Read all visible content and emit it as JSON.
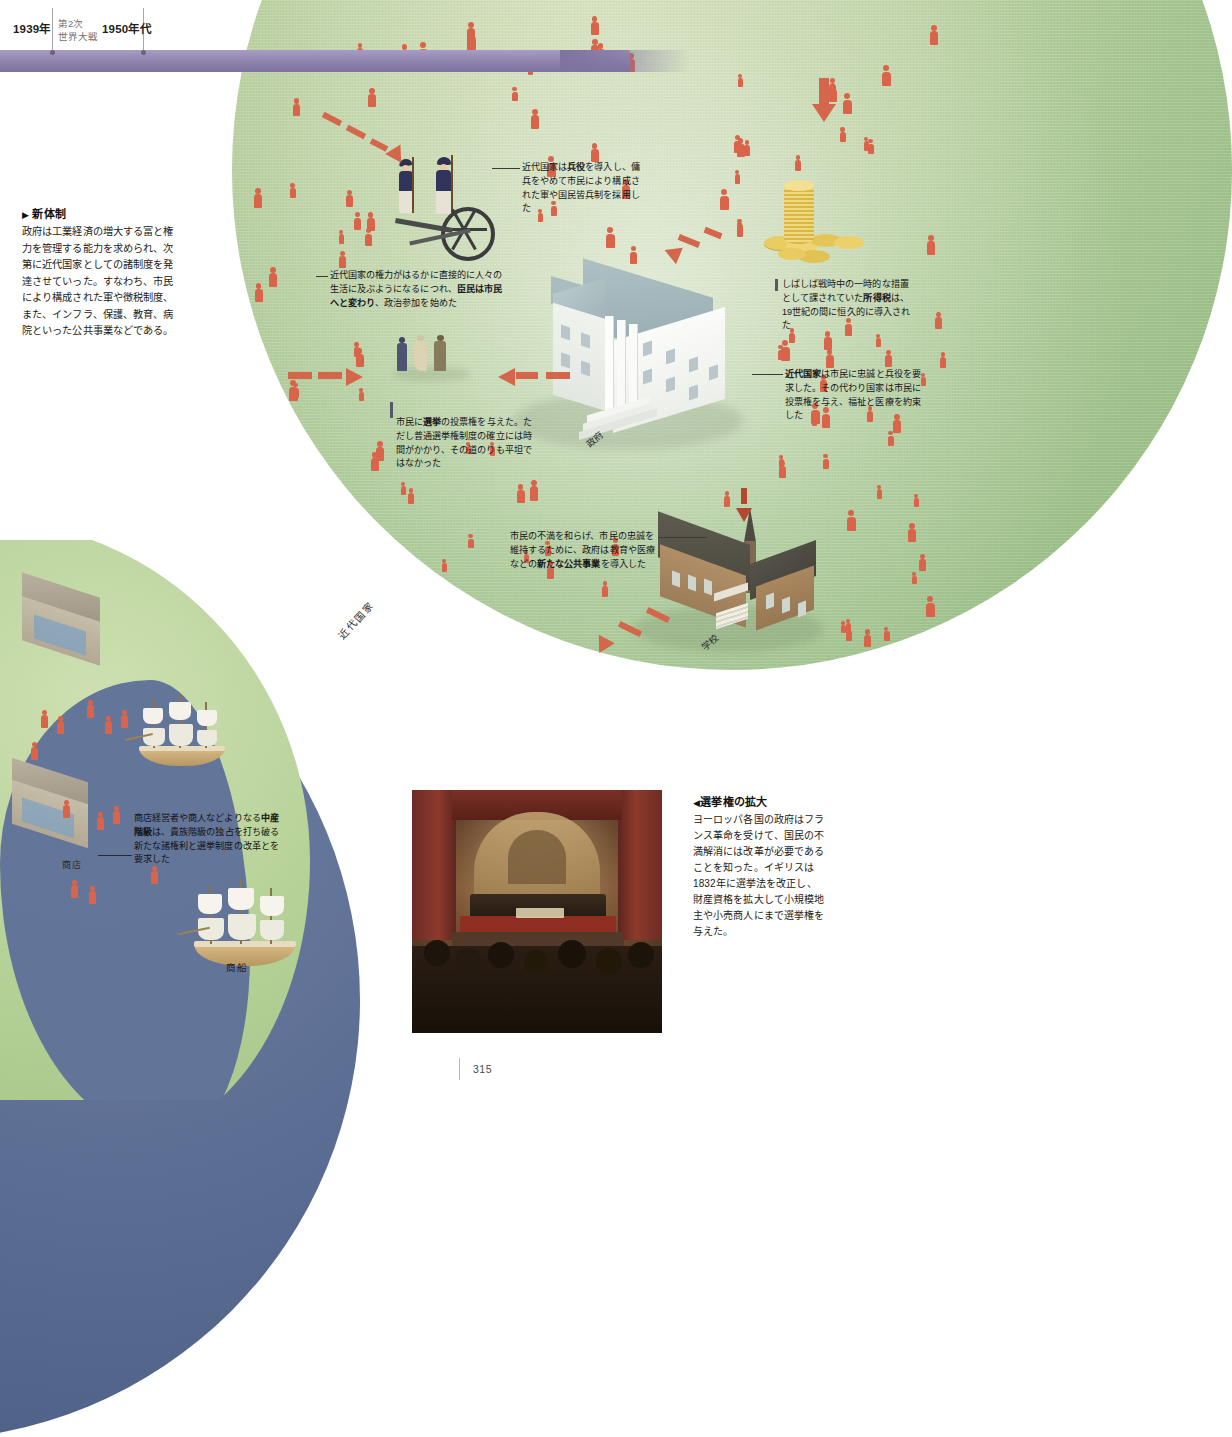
{
  "timeline": {
    "entries": [
      {
        "year": "1939年",
        "sub": "第2次\n世界大戦"
      },
      {
        "year": "1950年代",
        "sub": ""
      }
    ]
  },
  "intro": {
    "marker": "▶",
    "heading": "新体制",
    "body": "政府は工業経済の増大する富と権力を管理する能力を求められ、次第に近代国家としての諸制度を発達させていった。すなわち、市民により構成された軍や徴税制度、また、インフラ、保護、教育、病院といった公共事業などである。"
  },
  "callouts": {
    "conscription": "近代国家は兵役を導入し、傭兵をやめて市民により構成された軍や国民皆兵制を採用した",
    "conscription_bold": "兵役",
    "citizens": "近代国家の権力がはるかに直接的に人々の生活に及ぶようになるにつれ、臣民は市民へと変わり、政治参加を始めた",
    "citizens_bold": "臣民は市民へと変わり",
    "income_tax": "しばしば戦時中の一時的な措置として課されていた所得税は、19世紀の間に恒久的に導入された",
    "income_tax_bold": "所得税",
    "modern_state": "近代国家は市民に忠誠と兵役を要求した。その代わり国家は市民に投票権を与え、福祉と医療を約束した",
    "modern_state_bold": "近代国家",
    "suffrage": "市民に選挙の投票権を与えた。ただし普通選挙権制度の確立には時間がかかり、その道のりも平坦ではなかった",
    "suffrage_bold": "選挙",
    "public_works": "市民の不満を和らげ、市民の忠誠を維持するために、政府は教育や医療などの新たな公共事業を導入した",
    "public_works_bold": "新たな公共事業",
    "middle_class": "商店経営者や商人などよりなる中産階級は、貴族階級の独占を打ち破る新たな諸権利と選挙制度の改革とを要求した",
    "middle_class_bold": "中産階級"
  },
  "labels": {
    "government": "政府",
    "school": "学校",
    "modern_state_arc": "近代国家",
    "shop": "商店",
    "merchant_ship": "商船"
  },
  "figure_caption": {
    "marker": "◀",
    "heading": "選挙権の拡大",
    "body": "ヨーロッパ各国の政府はフランス革命を受けて、国民の不満解消には改革が必要であることを知った。イギリスは1832年に選挙法を改正し、財産資格を拡大して小規模地主や小売商人にまで選挙権を与えた。"
  },
  "footer": {
    "page_number": "315"
  },
  "colors": {
    "timeline_bar": "#8e83ae",
    "arc_green": "#b9cf9f",
    "sea_blue": "#5d6e94",
    "people_red": "#d9644a",
    "arrow_red": "#d4674b",
    "coin_gold": "#e8c34a",
    "school_brick": "#a6845e",
    "govt_white": "#f2f4f2"
  }
}
